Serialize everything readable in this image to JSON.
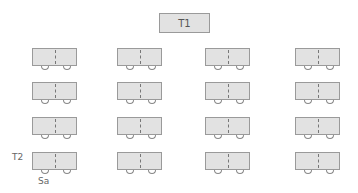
{
  "teacher_desk": {
    "label": "T1"
  },
  "row_label": "T2",
  "seat_label": "Sa",
  "layout": {
    "columns": [
      32,
      117,
      205,
      295
    ],
    "rows": [
      48,
      82,
      117,
      152
    ]
  },
  "desk_count": 16,
  "colors": {
    "desk_fill": "#e2e2e2",
    "desk_border": "#9a9a9a",
    "text": "#555555"
  }
}
